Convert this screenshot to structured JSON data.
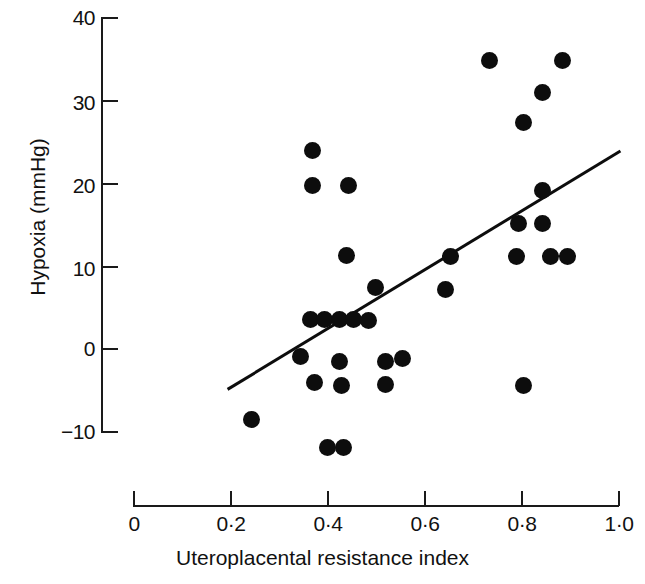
{
  "chart_data": {
    "type": "scatter",
    "title": "",
    "xlabel": "Uteroplacental resistance index",
    "ylabel": "Hypoxia (mmHg)",
    "xlim": [
      0,
      1.0
    ],
    "ylim": [
      -10,
      40
    ],
    "grid": false,
    "legend": null,
    "xticks": [
      0,
      0.2,
      0.4,
      0.6,
      0.8,
      1.0
    ],
    "xtick_labels": [
      "0",
      "0·2",
      "0·4",
      "0·6",
      "0·8",
      "1·0"
    ],
    "yticks": [
      -10,
      0,
      10,
      20,
      30,
      40
    ],
    "ytick_labels": [
      "−10",
      "0",
      "10",
      "20",
      "30",
      "40"
    ],
    "marker": "filled-circle",
    "marker_color": "#0d0d0d",
    "points": [
      {
        "x": 0.245,
        "y": -8.6
      },
      {
        "x": 0.37,
        "y": 23.9
      },
      {
        "x": 0.37,
        "y": 19.6
      },
      {
        "x": 0.445,
        "y": 19.6
      },
      {
        "x": 0.44,
        "y": 11.2
      },
      {
        "x": 0.365,
        "y": 3.4
      },
      {
        "x": 0.395,
        "y": 3.4
      },
      {
        "x": 0.425,
        "y": 3.4
      },
      {
        "x": 0.455,
        "y": 3.4
      },
      {
        "x": 0.485,
        "y": 3.3
      },
      {
        "x": 0.5,
        "y": 7.3
      },
      {
        "x": 0.345,
        "y": -1.0
      },
      {
        "x": 0.425,
        "y": -1.6
      },
      {
        "x": 0.52,
        "y": -1.6
      },
      {
        "x": 0.555,
        "y": -1.3
      },
      {
        "x": 0.375,
        "y": -4.2
      },
      {
        "x": 0.43,
        "y": -4.5
      },
      {
        "x": 0.52,
        "y": -4.4
      },
      {
        "x": 0.4,
        "y": -12.0
      },
      {
        "x": 0.435,
        "y": -12.0
      },
      {
        "x": 0.655,
        "y": 11.1
      },
      {
        "x": 0.645,
        "y": 7.1
      },
      {
        "x": 0.735,
        "y": 34.8
      },
      {
        "x": 0.885,
        "y": 34.8
      },
      {
        "x": 0.845,
        "y": 30.9
      },
      {
        "x": 0.805,
        "y": 27.2
      },
      {
        "x": 0.845,
        "y": 19.0
      },
      {
        "x": 0.795,
        "y": 15.1
      },
      {
        "x": 0.845,
        "y": 15.1
      },
      {
        "x": 0.79,
        "y": 11.0
      },
      {
        "x": 0.86,
        "y": 11.0
      },
      {
        "x": 0.895,
        "y": 11.0
      },
      {
        "x": 0.805,
        "y": -4.5
      }
    ],
    "trend_line": {
      "x0": 0.195,
      "y0": -5.0,
      "x1": 1.005,
      "y1": 23.8,
      "color": "#0d0d0d",
      "width": 3
    }
  }
}
